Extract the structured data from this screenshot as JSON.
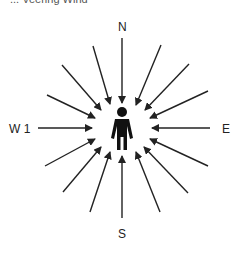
{
  "caption": "... Veering Wind",
  "labels": {
    "north": "N",
    "south": "S",
    "east": "E",
    "west": "W 1"
  },
  "diagram": {
    "center": [
      122,
      128
    ],
    "arrow_count": 16,
    "arrow_color": "#222222",
    "figure": "standing-person"
  }
}
